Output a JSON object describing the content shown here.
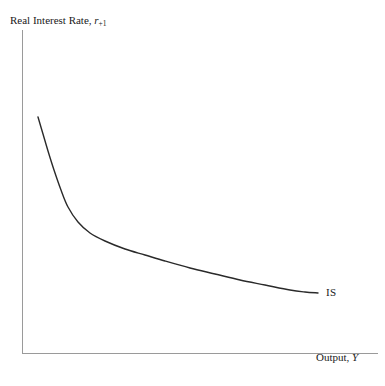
{
  "figure": {
    "background_color": "#ffffff",
    "width": 385,
    "height": 386
  },
  "axes": {
    "color": "#9a9a9a",
    "line_width": 1,
    "y_axis": {
      "x": 22,
      "y_top": 30,
      "y_bottom": 353
    },
    "x_axis": {
      "y": 353,
      "x_left": 22,
      "x_right": 378
    },
    "y_label_prefix": "Real Interest Rate, ",
    "y_label_symbol": "r",
    "y_label_subscript": "+1",
    "x_label_prefix": "Output, ",
    "x_label_symbol": "Y"
  },
  "chart_data": {
    "type": "line",
    "title": "",
    "xlabel": "Output, Y",
    "ylabel": "Real Interest Rate, r+1",
    "grid": false,
    "legend": "none",
    "xlim": [
      0,
      1
    ],
    "ylim": [
      0,
      1
    ],
    "axis_ticks": {
      "x": [],
      "y": []
    },
    "series": [
      {
        "name": "IS",
        "label": "IS",
        "color": "#2a2a2a",
        "line_width": 1.4,
        "description": "Downward-sloping convex IS curve, steep at low output and flattening asymptotically at high output",
        "points": [
          {
            "x": 38,
            "y": 117
          },
          {
            "x": 43,
            "y": 134
          },
          {
            "x": 48,
            "y": 151
          },
          {
            "x": 54,
            "y": 170
          },
          {
            "x": 61,
            "y": 190
          },
          {
            "x": 68,
            "y": 207
          },
          {
            "x": 78,
            "y": 222
          },
          {
            "x": 90,
            "y": 233
          },
          {
            "x": 105,
            "y": 241
          },
          {
            "x": 125,
            "y": 249
          },
          {
            "x": 145,
            "y": 255
          },
          {
            "x": 165,
            "y": 261
          },
          {
            "x": 190,
            "y": 268
          },
          {
            "x": 215,
            "y": 274
          },
          {
            "x": 240,
            "y": 280
          },
          {
            "x": 265,
            "y": 285
          },
          {
            "x": 290,
            "y": 290
          },
          {
            "x": 305,
            "y": 292
          },
          {
            "x": 318,
            "y": 293
          }
        ]
      }
    ],
    "annotations": [
      {
        "text": "IS",
        "x": 326,
        "y": 293,
        "anchor": "left"
      }
    ]
  },
  "labels": {
    "curve_label": "IS"
  }
}
